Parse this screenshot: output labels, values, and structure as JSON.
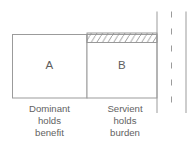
{
  "diagram": {
    "type": "easement-benefit-burden-diagram",
    "boxes": [
      {
        "id": "box-a",
        "label": "A",
        "caption_lines": [
          "Dominant",
          "holds",
          "benefit"
        ],
        "hatched": false
      },
      {
        "id": "box-b",
        "label": "B",
        "caption_lines": [
          "Servient",
          "holds",
          "burden"
        ],
        "hatched": true
      }
    ],
    "hatch_band": {
      "name": "burden-hatch-band",
      "pattern": "diagonal-lines",
      "stroke": "#8f8f8f"
    },
    "right_lines": [
      {
        "name": "solid-line-inner",
        "style": "solid"
      },
      {
        "name": "dashed-line-middle",
        "style": "dashed"
      },
      {
        "name": "solid-line-outer",
        "style": "solid"
      }
    ],
    "colors": {
      "stroke": "#9b9b9b",
      "text": "#626262",
      "letter": "#5e5e5e",
      "background": "#ffffff"
    }
  }
}
